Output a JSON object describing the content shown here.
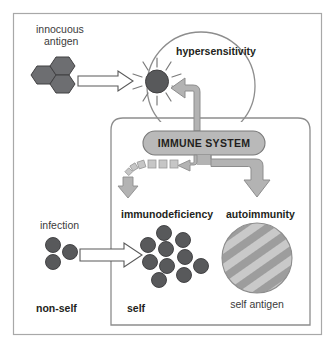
{
  "figure": {
    "title_visible": false,
    "background_color": "#ffffff",
    "outer_border_color": "#a8a8a8",
    "inner_box_border_color": "#8d8d8d"
  },
  "labels": {
    "innocuous_antigen_line1": "innocuous",
    "innocuous_antigen_line2": "antigen",
    "hypersensitivity": "hypersensitivity",
    "immune_system": "IMMUNE SYSTEM",
    "infection": "infection",
    "immunodeficiency": "immunodeficiency",
    "autoimmunity": "autoimmunity",
    "self_antigen": "self antigen",
    "non_self": "non-self",
    "self": "self"
  },
  "colors": {
    "antigen_hexagon_fill": "#6d6e71",
    "antigen_hexagon_stroke": "#414042",
    "activated_dot_fill": "#58595b",
    "activated_dot_stroke": "#414042",
    "pathogen_dot_fill": "#58595b",
    "pathogen_dot_stroke": "#3a3a3c",
    "gray_arrow_fill": "#b3b3b3",
    "gray_arrow_stroke": "#8d8d8d",
    "hollow_arrow_fill": "#ffffff",
    "hollow_arrow_stroke": "#595959",
    "pill_fill": "#b9b9b9",
    "pill_stroke": "#7a7a7a",
    "circle_outline": "#8d8d8d",
    "self_antigen_stripe_light": "#c4c4c4",
    "self_antigen_stripe_dark": "#9a9a9a",
    "ray_color": "#7a7a7a"
  },
  "shapes": {
    "antigen_hexagons_count": 3,
    "infection_dots_count": 3,
    "immunodeficiency_dots_count": 10,
    "starburst_rays_count": 12,
    "dashed_squares_count": 6
  },
  "arrows": {
    "antigen_to_activated": "hollow-right-arrow",
    "immune_to_hypersensitivity": "gray-elbow-arrow-up-left",
    "immune_to_immunodeficiency": "gray-dashed-degrading-arrow-down",
    "immune_to_autoimmunity": "gray-elbow-arrow-right-down",
    "infection_to_immunodeficiency": "hollow-right-arrow"
  }
}
